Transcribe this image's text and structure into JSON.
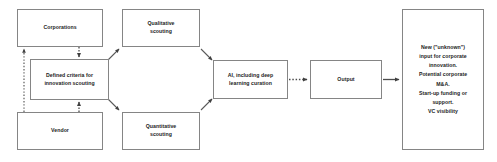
{
  "diagram": {
    "type": "flowchart",
    "title": "",
    "background_color": "#ffffff",
    "node_border_color": "#858585",
    "connector_color": "#4d4d4d",
    "text_color": "#1c1c1c",
    "nodes": [
      {
        "id": "corporations",
        "label": "Corporations",
        "x": 17,
        "y": 9,
        "w": 86,
        "h": 38
      },
      {
        "id": "vendor",
        "label": "Vendor",
        "x": 17,
        "y": 112,
        "w": 86,
        "h": 38
      },
      {
        "id": "defined-criteria",
        "label": "Defined criteria for\ninnovation scouting",
        "x": 30,
        "y": 59,
        "w": 79,
        "h": 41
      },
      {
        "id": "qualitative-scouting",
        "label": "Qualitative\nscouting",
        "x": 122,
        "y": 9,
        "w": 78,
        "h": 38
      },
      {
        "id": "quantitative-scouting",
        "label": "Quantitative\nscouting",
        "x": 122,
        "y": 112,
        "w": 78,
        "h": 38
      },
      {
        "id": "ai-curation",
        "label": "AI, including deep\nlearning curation",
        "x": 213,
        "y": 60,
        "w": 75,
        "h": 39
      },
      {
        "id": "output",
        "label": "Output",
        "x": 310,
        "y": 60,
        "w": 72,
        "h": 39
      },
      {
        "id": "outcomes",
        "label": "New (\"unknown\")\ninput for corporate\ninnovation.\nPotential corporate\nM&A.\nStart-up funding or\nsupport.\nVC visibility",
        "x": 402,
        "y": 9,
        "w": 82,
        "h": 141
      }
    ],
    "connectors": [
      {
        "id": "vendor-to-corporations",
        "from": "vendor",
        "to": "corporations",
        "style": "dotted",
        "arrow": "end"
      },
      {
        "id": "corporations-to-defined-criteria",
        "from": "corporations",
        "to": "defined-criteria",
        "style": "dotted",
        "arrow": "end"
      },
      {
        "id": "vendor-to-defined-criteria",
        "from": "vendor",
        "to": "defined-criteria",
        "style": "dotted",
        "arrow": "end"
      },
      {
        "id": "defined-criteria-to-qualitative",
        "from": "defined-criteria",
        "to": "qualitative-scouting",
        "style": "solid",
        "arrow": "end"
      },
      {
        "id": "defined-criteria-to-quantitative",
        "from": "defined-criteria",
        "to": "quantitative-scouting",
        "style": "solid",
        "arrow": "end"
      },
      {
        "id": "qualitative-to-ai",
        "from": "qualitative-scouting",
        "to": "ai-curation",
        "style": "solid",
        "arrow": "end"
      },
      {
        "id": "quantitative-to-ai",
        "from": "quantitative-scouting",
        "to": "ai-curation",
        "style": "solid",
        "arrow": "end"
      },
      {
        "id": "ai-to-output",
        "from": "ai-curation",
        "to": "output",
        "style": "dotted",
        "arrow": "end"
      },
      {
        "id": "output-to-outcomes",
        "from": "output",
        "to": "outcomes",
        "style": "solid",
        "arrow": "end"
      }
    ]
  }
}
